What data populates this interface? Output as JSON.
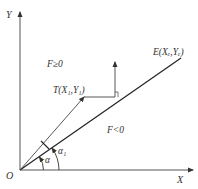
{
  "diagram": {
    "axes": {
      "x_label": "X",
      "y_label": "Y",
      "origin_label": "O"
    },
    "regions": {
      "above": "F≥0",
      "below": "F<0"
    },
    "points": {
      "end": {
        "name": "E",
        "label": "E(Xₑ,Yₑ)"
      },
      "current": {
        "name": "T",
        "label": "T(X₁,Y₁)"
      }
    },
    "angles": {
      "alpha": "α",
      "alpha1": "α₁"
    },
    "colors": {
      "line": "#222222",
      "axis": "#555555",
      "text": "#333333"
    }
  }
}
